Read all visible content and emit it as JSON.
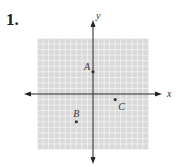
{
  "problem_number": "1.",
  "axes": {
    "x_label": "x",
    "y_label": "y"
  },
  "grid": {
    "min": -10,
    "max": 10,
    "color": "#d9d9d9",
    "line_color": "#f4f4f4"
  },
  "points": [
    {
      "label": "A",
      "x": 0,
      "y": 4
    },
    {
      "label": "B",
      "x": -3,
      "y": -5
    },
    {
      "label": "C",
      "x": 4,
      "y": -1
    }
  ]
}
